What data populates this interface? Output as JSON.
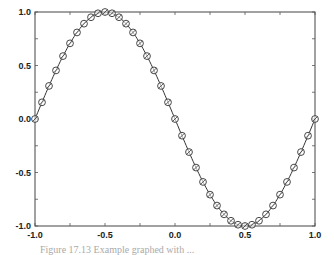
{
  "chart_data": {
    "type": "line",
    "title": "",
    "xlabel": "",
    "ylabel": "",
    "xlim": [
      -1.0,
      1.0
    ],
    "ylim": [
      -1.0,
      1.0
    ],
    "grid": false,
    "legend": null,
    "x_ticks": [
      "-1.0",
      "-0.5",
      "0.0",
      "0.5",
      "1.0"
    ],
    "y_ticks": [
      "1.0",
      "0.5",
      "0.0",
      "-0.5",
      "-1.0"
    ],
    "series": [
      {
        "name": "curve",
        "style": "solid line",
        "function": "y = -sin(pi*x)",
        "x": [
          -1.0,
          -0.95,
          -0.9,
          -0.85,
          -0.8,
          -0.75,
          -0.7,
          -0.65,
          -0.6,
          -0.55,
          -0.5,
          -0.45,
          -0.4,
          -0.35,
          -0.3,
          -0.25,
          -0.2,
          -0.15,
          -0.1,
          -0.05,
          0.0,
          0.05,
          0.1,
          0.15,
          0.2,
          0.25,
          0.3,
          0.35,
          0.4,
          0.45,
          0.5,
          0.55,
          0.6,
          0.65,
          0.7,
          0.75,
          0.8,
          0.85,
          0.9,
          0.95,
          1.0
        ],
        "values": [
          0.0,
          0.156,
          0.309,
          0.454,
          0.588,
          0.707,
          0.809,
          0.891,
          0.951,
          0.988,
          1.0,
          0.988,
          0.951,
          0.891,
          0.809,
          0.707,
          0.588,
          0.454,
          0.309,
          0.156,
          0.0,
          -0.156,
          -0.309,
          -0.454,
          -0.588,
          -0.707,
          -0.809,
          -0.891,
          -0.951,
          -0.988,
          -1.0,
          -0.988,
          -0.951,
          -0.891,
          -0.809,
          -0.707,
          -0.588,
          -0.454,
          -0.309,
          -0.156,
          0.0
        ]
      },
      {
        "name": "samples",
        "style": "circle-slash markers",
        "x": "same as curve",
        "values": "same as curve"
      }
    ]
  },
  "caption": {
    "text": "Figure 17.13  Example graphed with ..."
  }
}
